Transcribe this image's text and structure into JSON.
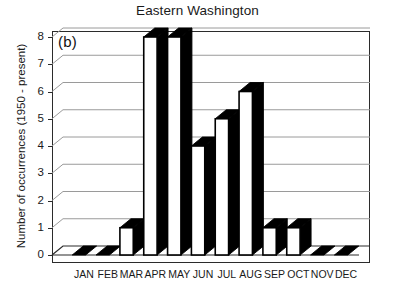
{
  "chart_data": {
    "type": "bar",
    "title": "Eastern Washington",
    "panel_label": "(b)",
    "xlabel": "",
    "ylabel": "Number of occurrences (1950 - present)",
    "categories": [
      "JAN",
      "FEB",
      "MAR",
      "APR",
      "MAY",
      "JUN",
      "JUL",
      "AUG",
      "SEP",
      "OCT",
      "NOV",
      "DEC"
    ],
    "values": [
      0,
      0,
      1,
      8,
      8,
      4,
      5,
      6,
      1,
      1,
      0,
      0
    ],
    "ylim": [
      0,
      8
    ],
    "yticks": [
      0,
      1,
      2,
      3,
      4,
      5,
      6,
      7,
      8
    ],
    "ytick_labels": [
      "0",
      "1",
      "2",
      "3",
      "4",
      "5",
      "6",
      "7",
      "8"
    ],
    "grid": true,
    "grid_axis": "y",
    "legend": false,
    "legend_position": "none",
    "style": "3d-column",
    "colors": {
      "bar_face": "#ffffff",
      "bar_edge": "#000000",
      "bar_side": "#000000",
      "gridline": "#9a9a9a",
      "axis": "#2b2b2b",
      "text": "#1a1a1a",
      "background": "#ffffff"
    }
  }
}
